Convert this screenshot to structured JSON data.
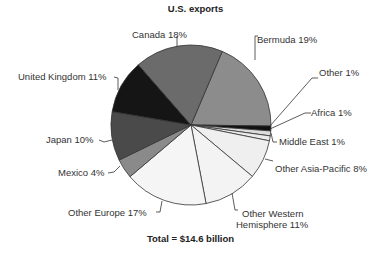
{
  "chart_data": {
    "type": "pie",
    "title": "U.S. exports",
    "footer": "Total = $14.6 billion",
    "total_value": "$14.6 billion",
    "start_angle_deg": 23,
    "direction": "clockwise",
    "slices": [
      {
        "label": "Bermuda",
        "value": 19,
        "text": "Bermuda 19%",
        "color": "#8c8c8c"
      },
      {
        "label": "Other",
        "value": 1,
        "text": "Other 1%",
        "color": "#111111"
      },
      {
        "label": "Africa",
        "value": 1,
        "text": "Africa 1%",
        "color": "#dcdcdc"
      },
      {
        "label": "Middle East",
        "value": 1,
        "text": "Middle East 1%",
        "color": "#ececec"
      },
      {
        "label": "Other Asia-Pacific",
        "value": 8,
        "text": "Other Asia-Pacific 8%",
        "color": "#efefef"
      },
      {
        "label": "Other Western Hemisphere",
        "value": 11,
        "text": "Other Western Hemisphere 11%",
        "color": "#f3f3f3"
      },
      {
        "label": "Other Europe",
        "value": 17,
        "text": "Other Europe 17%",
        "color": "#f5f5f5"
      },
      {
        "label": "Mexico",
        "value": 4,
        "text": "Mexico 4%",
        "color": "#8a8a8a"
      },
      {
        "label": "Japan",
        "value": 10,
        "text": "Japan 10%",
        "color": "#4a4a4a"
      },
      {
        "label": "United Kingdom",
        "value": 11,
        "text": "United Kingdom 11%",
        "color": "#151515"
      },
      {
        "label": "Canada",
        "value": 18,
        "text": "Canada 18%",
        "color": "#6b6b6b"
      }
    ]
  },
  "labels": {
    "canada": "Canada 18%",
    "bermuda": "Bermuda 19%",
    "other": "Other 1%",
    "africa": "Africa 1%",
    "middle_east": "Middle East 1%",
    "other_asia_pacific": "Other Asia-Pacific 8%",
    "other_western_line1": "Other Western",
    "other_western_line2": "Hemisphere 11%",
    "other_europe": "Other Europe 17%",
    "mexico": "Mexico 4%",
    "japan": "Japan 10%",
    "united_kingdom": "United Kingdom 11%"
  }
}
